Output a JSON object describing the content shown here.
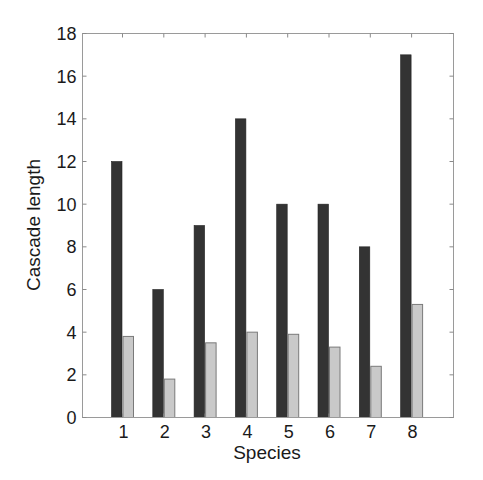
{
  "chart_data": {
    "type": "bar",
    "title": "",
    "xlabel": "Species",
    "ylabel": "Cascade length",
    "categories": [
      "1",
      "2",
      "3",
      "4",
      "5",
      "6",
      "7",
      "8"
    ],
    "series": [
      {
        "name": "Series A (dark)",
        "color": "#333333",
        "values": [
          12,
          6,
          9,
          14,
          10,
          10,
          8,
          17
        ]
      },
      {
        "name": "Series B (light)",
        "color": "#c9c9c9",
        "values": [
          3.8,
          1.8,
          3.5,
          4.0,
          3.9,
          3.3,
          2.4,
          5.3
        ]
      }
    ],
    "ylim": [
      0,
      18
    ],
    "yticks": [
      0,
      2,
      4,
      6,
      8,
      10,
      12,
      14,
      16,
      18
    ],
    "grid": false,
    "legend": "none",
    "box": true
  }
}
